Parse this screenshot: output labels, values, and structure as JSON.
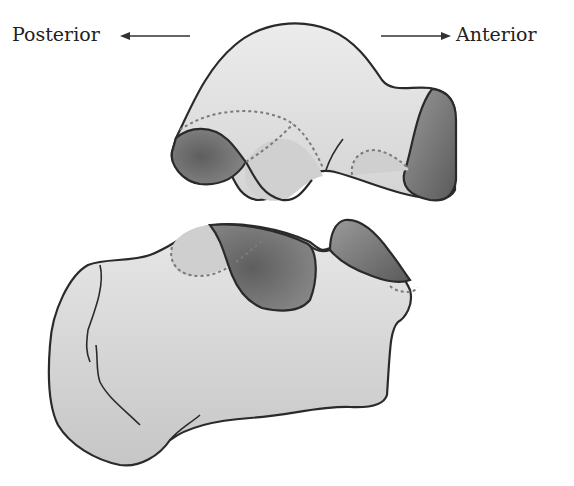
{
  "figure": {
    "labels": {
      "posterior": "Posterior",
      "anterior": "Anterior"
    },
    "direction_arrows": [
      {
        "name": "posterior-arrow",
        "direction": "left"
      },
      {
        "name": "anterior-arrow",
        "direction": "right"
      }
    ],
    "colors": {
      "outline": "#2a2a2a",
      "bone_fill": "#d9d9d9",
      "bone_light": "#e6e6e6",
      "facet_dark": "#6e6e6e",
      "facet_mid": "#8c8c8c",
      "facet_light": "#bdbdbd",
      "dashed": "#7a7a7a",
      "text": "#222222"
    }
  }
}
